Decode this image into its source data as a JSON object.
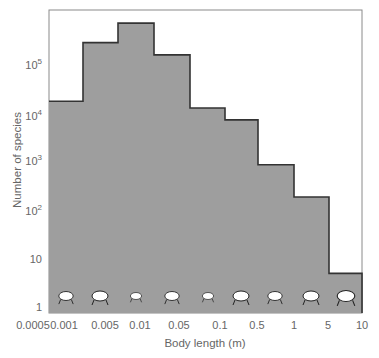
{
  "chart_data": {
    "type": "bar",
    "subtype": "histogram-step",
    "title": "",
    "xlabel": "Body length (m)",
    "ylabel": "Number of species",
    "yscale": "log",
    "ylim": [
      1,
      1000000
    ],
    "grid": false,
    "legend": null,
    "x_tick_labels": [
      "0.0005",
      "0.001",
      "0.005",
      "0.01",
      "0.05",
      "0.1",
      "0.5",
      "1",
      "5",
      "10"
    ],
    "y_tick_labels": [
      "1",
      "10",
      "10^2",
      "10^3",
      "10^4",
      "10^5"
    ],
    "categories": [
      "0.0005-0.001",
      "0.001-0.005",
      "0.005-0.01",
      "0.01-0.05",
      "0.05-0.1",
      "0.1-0.5",
      "0.5-1",
      "1-5",
      "5-10"
    ],
    "values": [
      15000,
      230000,
      570000,
      130000,
      11000,
      6300,
      780,
      175,
      5
    ],
    "annotations": [
      "mite",
      "fly",
      "ant",
      "stick-insect",
      "beetle",
      "rat",
      "dog",
      "horse",
      "elephant"
    ],
    "fill_color": "#9e9e9e",
    "edge_color": "#333333"
  },
  "axes": {
    "xlabel": "Body length (m)",
    "ylabel": "Number of species",
    "yticks": [
      {
        "base": "1",
        "exp": ""
      },
      {
        "base": "10",
        "exp": ""
      },
      {
        "base": "10",
        "exp": "2"
      },
      {
        "base": "10",
        "exp": "3"
      },
      {
        "base": "10",
        "exp": "4"
      },
      {
        "base": "10",
        "exp": "5"
      }
    ],
    "xticks": [
      "0.0005",
      "0.001",
      "0.005",
      "0.01",
      "0.05",
      "0.1",
      "0.5",
      "1",
      "5",
      "10"
    ]
  }
}
